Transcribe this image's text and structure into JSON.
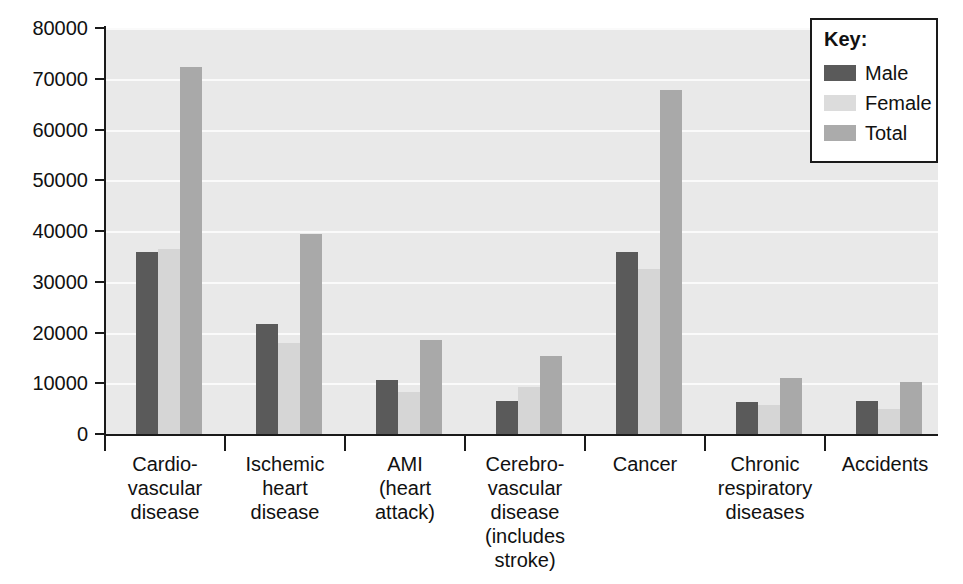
{
  "chart_data": {
    "type": "bar",
    "title": "",
    "xlabel": "",
    "ylabel": "",
    "ylim": [
      0,
      80000
    ],
    "ytick_values": [
      80000,
      70000,
      60000,
      50000,
      40000,
      30000,
      20000,
      10000,
      0
    ],
    "ytick_labels": [
      "80000",
      "70000",
      "60000",
      "50000",
      "40000",
      "30000",
      "20000",
      "10000",
      "0"
    ],
    "grid": true,
    "legend_position": "top-right",
    "categories": [
      "Cardio-\nvascular\ndisease",
      "Ischemic\nheart\ndisease",
      "AMI\n(heart\nattack)",
      "Cerebro-\nvascular\ndisease\n(includes\nstroke)",
      "Cancer",
      "Chronic\nrespiratory\ndiseases",
      "Accidents"
    ],
    "category_lines": [
      [
        "Cardio-",
        "vascular",
        "disease"
      ],
      [
        "Ischemic",
        "heart",
        "disease"
      ],
      [
        "AMI",
        "(heart",
        "attack)"
      ],
      [
        "Cerebro-",
        "vascular",
        "disease",
        "(includes",
        "stroke)"
      ],
      [
        "Cancer"
      ],
      [
        "Chronic",
        "respiratory",
        "diseases"
      ],
      [
        "Accidents"
      ]
    ],
    "series": [
      {
        "name": "Male",
        "color": "#5a5a5a",
        "values": [
          35800,
          21600,
          10600,
          6500,
          35900,
          6300,
          6600
        ]
      },
      {
        "name": "Female",
        "color": "#d6d6d6",
        "values": [
          36500,
          17900,
          8300,
          9300,
          32600,
          5700,
          4900
        ]
      },
      {
        "name": "Total",
        "color": "#a9a9a9",
        "values": [
          72300,
          39500,
          18600,
          15300,
          67800,
          11100,
          10300
        ]
      }
    ]
  },
  "legend": {
    "title": "Key:",
    "entries": [
      {
        "label": "Male",
        "swatch": "male-swatch"
      },
      {
        "label": "Female",
        "swatch": "female-swatch"
      },
      {
        "label": "Total",
        "swatch": "total-swatch"
      }
    ]
  },
  "colors": {
    "male": "#5a5a5a",
    "female": "#d6d6d6",
    "total": "#a9a9a9",
    "plot_background": "#e9e9e9",
    "gridline": "#fafafa",
    "axis": "#1a1a1a",
    "text": "#111111",
    "legend_background": "#ffffff"
  }
}
